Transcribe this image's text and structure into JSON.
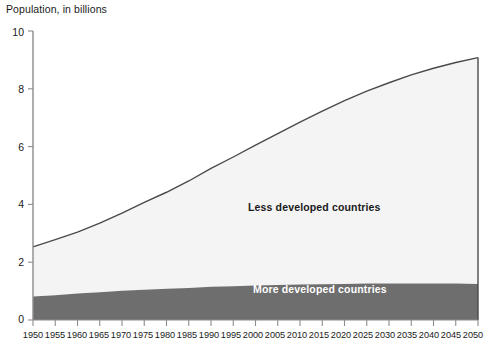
{
  "chart_data": {
    "type": "area",
    "title": "Population, in billions",
    "xlabel": "",
    "ylabel": "Population, in billions",
    "xlim": [
      1950,
      2050
    ],
    "ylim": [
      0,
      10
    ],
    "grid": false,
    "stacked": true,
    "legend_position": "inline-annotations",
    "x": [
      1950,
      1955,
      1960,
      1965,
      1970,
      1975,
      1980,
      1985,
      1990,
      1995,
      2000,
      2005,
      2010,
      2015,
      2020,
      2025,
      2030,
      2035,
      2040,
      2045,
      2050
    ],
    "xticklabels": [
      "1950",
      "1955",
      "1960",
      "1965",
      "1970",
      "1975",
      "1980",
      "1985",
      "1990",
      "1995",
      "2000",
      "2005",
      "2010",
      "2015",
      "2020",
      "2025",
      "2030",
      "2035",
      "2040",
      "2045",
      "2050"
    ],
    "yticks": [
      0,
      2,
      4,
      6,
      8,
      10
    ],
    "yticklabels": [
      "0",
      "2",
      "4",
      "6",
      "8",
      "10"
    ],
    "series": [
      {
        "name": "More developed countries",
        "color": "#6e6e6e",
        "label_color": "#ffffff",
        "values": [
          0.81,
          0.86,
          0.92,
          0.96,
          1.01,
          1.05,
          1.08,
          1.11,
          1.15,
          1.17,
          1.19,
          1.21,
          1.23,
          1.24,
          1.25,
          1.26,
          1.26,
          1.26,
          1.26,
          1.26,
          1.25
        ]
      },
      {
        "name": "Less developed countries",
        "color": "#f4f4f4",
        "label_color": "#1a1a1a",
        "values": [
          1.72,
          1.92,
          2.12,
          2.39,
          2.69,
          3.02,
          3.34,
          3.7,
          4.1,
          4.47,
          4.86,
          5.24,
          5.62,
          5.99,
          6.34,
          6.66,
          6.95,
          7.22,
          7.45,
          7.65,
          7.83
        ]
      }
    ],
    "totals": [
      2.53,
      2.78,
      3.04,
      3.35,
      3.7,
      4.07,
      4.42,
      4.81,
      5.25,
      5.64,
      6.05,
      6.45,
      6.85,
      7.23,
      7.59,
      7.92,
      8.21,
      8.48,
      8.71,
      8.91,
      9.08
    ],
    "annotations": [
      {
        "text": "Less developed countries",
        "x": 2010,
        "y": 4.2
      },
      {
        "text": "More developed countries",
        "x": 2012,
        "y": 0.62
      }
    ],
    "colors": {
      "total_line": "#4a4a4a",
      "more_developed_fill": "#6e6e6e",
      "less_developed_fill": "#f4f4f4",
      "axis": "#8c8c8c",
      "background": "#ffffff",
      "text": "#1a1a1a"
    }
  }
}
